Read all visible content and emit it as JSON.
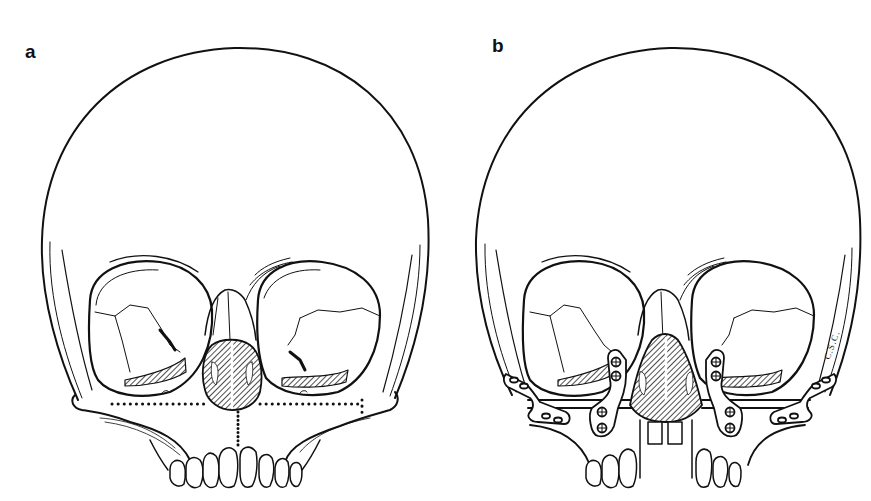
{
  "figure": {
    "panels": [
      {
        "label": "a",
        "content": "Skull with dotted osteotomy lines across maxilla and vertical midline split, hatched nasal aperture",
        "ink_color": "#111111"
      },
      {
        "label": "b",
        "content": "Skull after osteotomy with bilateral zygomatic and paranasal fixation plates with screws, midline gap between central incisors",
        "ink_color": "#111111",
        "signature": "C.S.C."
      }
    ]
  },
  "colors": {
    "background": "#ffffff",
    "ink": "#111111",
    "hatch": "#222222"
  }
}
